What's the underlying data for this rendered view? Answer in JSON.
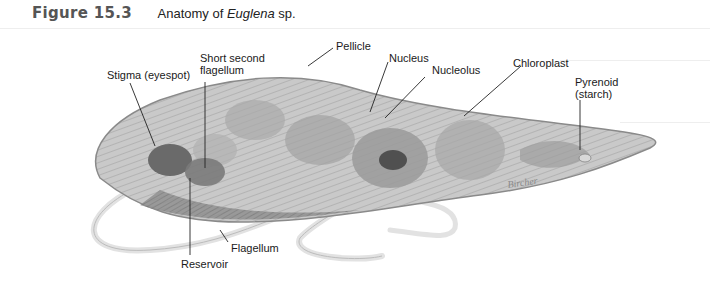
{
  "figure": {
    "number": "Figure 15.3",
    "title_prefix": "Anatomy of ",
    "title_italic": "Euglena",
    "title_suffix": " sp."
  },
  "labels": {
    "pellicle": "Pellicle",
    "short_second_flagellum_1": "Short second",
    "short_second_flagellum_2": "flagellum",
    "nucleus": "Nucleus",
    "nucleolus": "Nucleolus",
    "chloroplast": "Chloroplast",
    "stigma": "Stigma (eyespot)",
    "pyrenoid_1": "Pyrenoid",
    "pyrenoid_2": "(starch)",
    "flagellum": "Flagellum",
    "reservoir": "Reservoir"
  },
  "signature": "Bircher"
}
